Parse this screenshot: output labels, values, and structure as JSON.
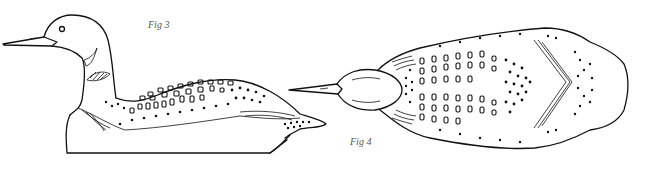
{
  "figures": [
    {
      "caption": "Fig 3",
      "subject": "loon decoy side view"
    },
    {
      "caption": "Fig 4",
      "subject": "loon decoy top view"
    }
  ],
  "colors": {
    "line": "#111111",
    "background": "#ffffff",
    "caption": "#555555"
  }
}
